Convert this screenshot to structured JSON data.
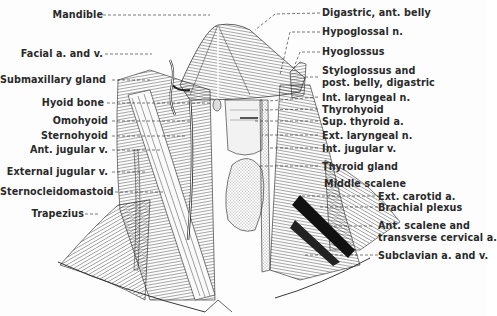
{
  "figure": {
    "colors": {
      "ink": "#1e1e1e",
      "paper": "#fdfdfd",
      "shade": "#bdbdbd"
    }
  },
  "labels_left": [
    {
      "id": "mandible",
      "text": "Mandible"
    },
    {
      "id": "facial",
      "text": "Facial a. and v."
    },
    {
      "id": "submax",
      "text": "Submaxillary gland"
    },
    {
      "id": "hyoid",
      "text": "Hyoid bone"
    },
    {
      "id": "omohyoid",
      "text": "Omohyoid"
    },
    {
      "id": "sternohyoid",
      "text": "Sternohyoid"
    },
    {
      "id": "antjug",
      "text": "Ant. jugular v."
    },
    {
      "id": "extjug",
      "text": "External jugular v."
    },
    {
      "id": "scm",
      "text": "Sternocleidomastoid"
    },
    {
      "id": "trapezius",
      "text": "Trapezius"
    }
  ],
  "labels_right": [
    {
      "id": "digastric",
      "text": "Digastric, ant. belly"
    },
    {
      "id": "hypoglossal",
      "text": "Hypoglossal n."
    },
    {
      "id": "hyoglossus",
      "text": "Hyoglossus"
    },
    {
      "id": "styloglossus1",
      "text": "Styloglossus and"
    },
    {
      "id": "styloglossus2",
      "text": "post. belly, digastric"
    },
    {
      "id": "intlar",
      "text": "Int. laryngeal n."
    },
    {
      "id": "thyrohyoid",
      "text": "Thyrohyoid"
    },
    {
      "id": "supthy",
      "text": "Sup. thyroid a."
    },
    {
      "id": "extlar",
      "text": "Ext. laryngeal n."
    },
    {
      "id": "intjug",
      "text": "Int. jugular v."
    },
    {
      "id": "thyroid",
      "text": "Thyroid gland"
    },
    {
      "id": "midscal",
      "text": "Middle scalene"
    },
    {
      "id": "extcar",
      "text": "Ext. carotid a."
    },
    {
      "id": "brachial",
      "text": "Brachial plexus"
    },
    {
      "id": "antscal1",
      "text": "Ant. scalene and"
    },
    {
      "id": "antscal2",
      "text": "transverse cervical a."
    },
    {
      "id": "subclav",
      "text": "Subclavian a. and v."
    }
  ]
}
